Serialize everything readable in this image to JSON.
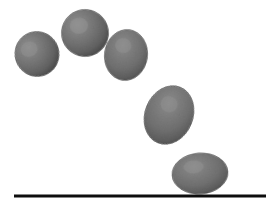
{
  "scene": {
    "title": "Bouncing ball motion sequence",
    "description": "Grayscale photographic sequence of a deformable ball following a parabolic arc and landing on a flat surface",
    "width": 275,
    "height": 211,
    "background_color": "#ffffff"
  },
  "palette": {
    "ball_highlight": "#8d8d8d",
    "ball_mid": "#767676",
    "ball_base": "#6e6e6e",
    "ball_shadow": "#4a4a4a",
    "ball_edge": "#3a3a3a",
    "ground_color": "#0d0d0d",
    "background": "#ffffff"
  },
  "ground": {
    "label": "ground-line",
    "x_start": 14,
    "x_end": 266,
    "y": 196,
    "thickness": 3,
    "color": "#0d0d0d"
  },
  "balls": [
    {
      "id": "ball-1",
      "label": "Ball position 1 — ascending left",
      "cx": 37,
      "cy": 54,
      "rx": 22,
      "ry": 22.5,
      "rotation": -18,
      "phase": "rising"
    },
    {
      "id": "ball-2",
      "label": "Ball position 2 — near apex",
      "cx": 85,
      "cy": 33,
      "rx": 23.5,
      "ry": 23.5,
      "rotation": -8,
      "phase": "apex"
    },
    {
      "id": "ball-3",
      "label": "Ball position 3 — beginning descent",
      "cx": 126,
      "cy": 55,
      "rx": 21.5,
      "ry": 25.5,
      "rotation": 8,
      "phase": "descending"
    },
    {
      "id": "ball-4",
      "label": "Ball position 4 — fast descent, stretched",
      "cx": 169,
      "cy": 115,
      "rx": 24,
      "ry": 30,
      "rotation": 22,
      "phase": "descending-stretched"
    },
    {
      "id": "ball-5",
      "label": "Ball position 5 — impact, squashed on ground",
      "cx": 200,
      "cy": 173.5,
      "rx": 28,
      "ry": 20.5,
      "rotation": -4,
      "phase": "impact-squashed"
    }
  ],
  "chart_data": {
    "type": "scatter",
    "xlabel": "",
    "ylabel": "",
    "xlim": [
      0,
      275
    ],
    "ylim": [
      211,
      0
    ],
    "grid": false,
    "legend": "none",
    "categories": [
      "position 1",
      "position 2",
      "position 3",
      "position 4",
      "position 5"
    ],
    "series": [
      {
        "name": "ball centroid",
        "x": [
          37,
          85,
          126,
          169,
          200
        ],
        "y": [
          54,
          33,
          55,
          115,
          173.5
        ]
      },
      {
        "name": "ball width (rx)",
        "values": [
          22,
          23.5,
          21.5,
          24,
          28
        ]
      },
      {
        "name": "ball height (ry)",
        "values": [
          22.5,
          23.5,
          25.5,
          30,
          20.5
        ]
      },
      {
        "name": "rotation degrees",
        "values": [
          -18,
          -8,
          8,
          22,
          -4
        ]
      }
    ],
    "annotations": [
      "ground line at y = 196, spanning x = 14 to x = 266"
    ]
  }
}
